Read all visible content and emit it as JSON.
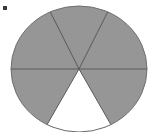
{
  "figure": {
    "kind": "shaded-circle-fraction-diagram",
    "bullet_label": "",
    "title": "",
    "colors": {
      "shaded_fill": "#969696",
      "unshaded_fill": "#ffffff",
      "outline": "#6e6e6e",
      "divider": "#5a5a5a",
      "bullet": "#3a3a3a",
      "background": "#ffffff"
    },
    "circle": {
      "center_x": 79,
      "center_y": 69,
      "radius_x": 68,
      "radius_y": 63
    },
    "sectors": [
      {
        "name": "upper-left-sector",
        "start_deg": 180,
        "end_deg": 245,
        "shaded": true
      },
      {
        "name": "top-sector",
        "start_deg": 245,
        "end_deg": 295,
        "shaded": true
      },
      {
        "name": "upper-right-sector",
        "start_deg": 295,
        "end_deg": 360,
        "shaded": true
      },
      {
        "name": "lower-right-sector",
        "start_deg": 0,
        "end_deg": 62,
        "shaded": true
      },
      {
        "name": "bottom-unshaded-sector",
        "start_deg": 62,
        "end_deg": 118,
        "shaded": false
      },
      {
        "name": "lower-left-sector",
        "start_deg": 118,
        "end_deg": 180,
        "shaded": true
      }
    ],
    "dividers_deg": [
      0,
      62,
      118,
      180,
      245,
      295
    ],
    "counts": {
      "total_sectors": 6,
      "shaded_sectors": 5,
      "unshaded_sectors": 1,
      "fraction_shaded": "5/6"
    }
  },
  "chart_data": {
    "type": "pie",
    "title": "",
    "categories": [
      "Shaded",
      "Unshaded"
    ],
    "values": [
      5,
      6
    ],
    "labels": [
      "5 of 6 sectors shaded",
      "1 of 6 sectors unshaded"
    ],
    "slice_count": 6,
    "slice_angles_deg": [
      65,
      50,
      65,
      62,
      56,
      62
    ],
    "slice_shaded": [
      true,
      true,
      true,
      true,
      false,
      true
    ],
    "legend": [],
    "grid": false,
    "xlabel": "",
    "ylabel": ""
  }
}
